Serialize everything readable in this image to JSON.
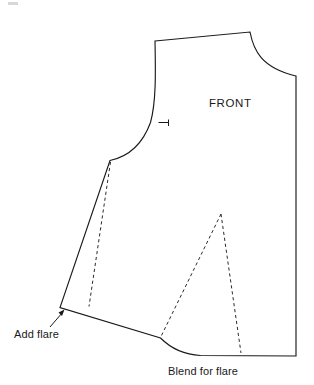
{
  "diagram": {
    "piece_label": "FRONT",
    "background_color": "#ffffff",
    "line_color": "#1a1a1a",
    "dashed_line_color": "#2b2b2b",
    "annotations": [
      {
        "id": "add-flare",
        "text": "Add flare",
        "x": 14,
        "y": 334,
        "points_to": {
          "x": 62,
          "y": 310
        }
      },
      {
        "id": "blend-for-flare",
        "text": "Blend for flare",
        "x": 166,
        "y": 374,
        "points_to": null
      }
    ],
    "marks": {
      "notch_label": "armhole-notch",
      "notch_x": 163,
      "notch_y": 122
    },
    "geometry": {
      "outline_path": "M 155 41 L 250 32 C 254 52 262 68 296 76 L 296 356 L 200 355.5 C 178 354 168 346 160 338 L 60 307.5 L 110 160.5 C 128 157 142 144 150 122 C 156 102 155 70 155 41 Z",
      "hem_right_end": {
        "x": 296,
        "y": 356
      },
      "hem_left_corner": {
        "x": 60,
        "y": 307
      },
      "underarm_point": {
        "x": 110,
        "y": 160
      },
      "shoulder_left": {
        "x": 155,
        "y": 41
      },
      "shoulder_right": {
        "x": 250,
        "y": 32
      },
      "center_front_top": {
        "x": 296,
        "y": 76
      },
      "side_flare_line": {
        "x1": 110,
        "y1": 162,
        "x2": 89,
        "y2": 306
      },
      "dart_apex": {
        "x": 221,
        "y": 214
      },
      "dart_left_base": {
        "x": 161,
        "y": 336
      },
      "dart_right_base": {
        "x": 241,
        "y": 353
      }
    }
  }
}
